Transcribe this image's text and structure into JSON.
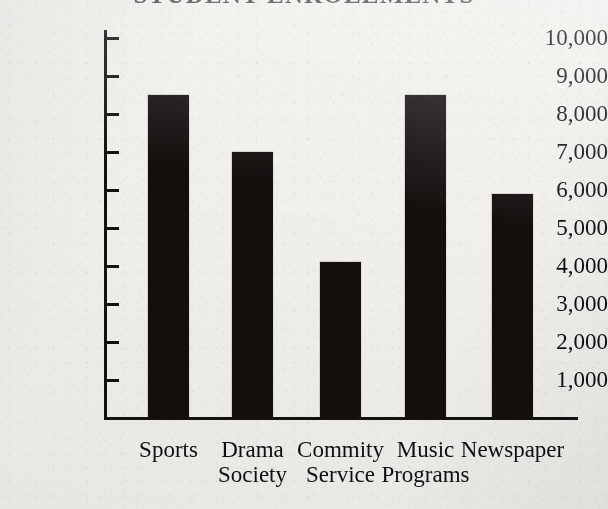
{
  "chart_data": {
    "type": "bar",
    "title": "",
    "subtitle": "",
    "xlabel": "",
    "ylabel": "",
    "categories": [
      "Sports",
      "Drama Society",
      "Commity Service",
      "Music Programs",
      "Newspaper"
    ],
    "category_lines": [
      [
        "Sports",
        ""
      ],
      [
        "Drama",
        "Society"
      ],
      [
        "Commity",
        "Service"
      ],
      [
        "Music",
        "Programs"
      ],
      [
        "Newspaper",
        ""
      ]
    ],
    "values": [
      8500,
      7000,
      4100,
      8500,
      5900
    ],
    "ylim": [
      0,
      10000
    ],
    "ytick_values": [
      10000,
      9000,
      8000,
      7000,
      6000,
      5000,
      4000,
      3000,
      2000,
      1000
    ],
    "ytick_labels": [
      "10,000",
      "9,000",
      "8,000",
      "7,000",
      "6,000",
      "5,000",
      "4,000",
      "3,000",
      "2,000",
      "1,000"
    ],
    "grid": false,
    "legend": false,
    "legend_position": "none",
    "bar_color": "#120f0d",
    "axis_color": "#14120f",
    "background_color": "#f1efeb"
  },
  "title": {
    "text": "STUDENT ENROLLMENTS",
    "note": "cropped at top edge of image; only letter bottoms visible"
  }
}
